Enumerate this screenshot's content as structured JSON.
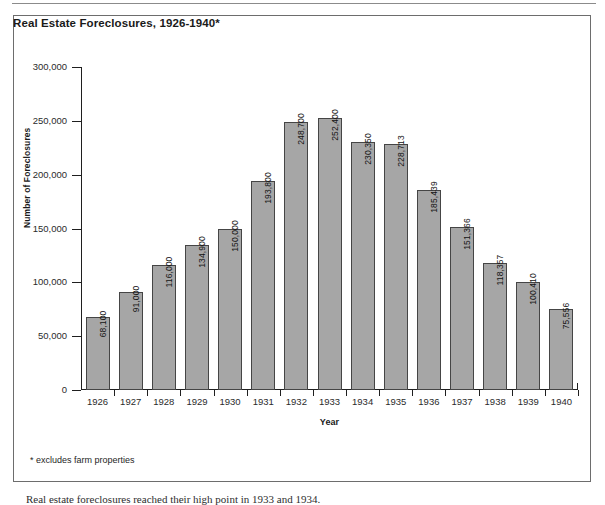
{
  "figure": {
    "title": "Real Estate Foreclosures, 1926-1940*",
    "footnote": "* excludes farm properties",
    "caption": "Real estate foreclosures reached their high point in 1933 and 1934."
  },
  "chart_data": {
    "type": "bar",
    "title": "Real Estate Foreclosures, 1926-1940*",
    "xlabel": "Year",
    "ylabel": "Number of Foreclosures",
    "categories": [
      "1926",
      "1927",
      "1928",
      "1929",
      "1930",
      "1931",
      "1932",
      "1933",
      "1934",
      "1935",
      "1936",
      "1937",
      "1938",
      "1939",
      "1940"
    ],
    "values": [
      68100,
      91000,
      116000,
      134900,
      150000,
      193800,
      248700,
      252400,
      230350,
      228713,
      185439,
      151366,
      118357,
      100410,
      75556
    ],
    "value_labels": [
      "68,100",
      "91,000",
      "116,000",
      "134,900",
      "150,000",
      "193,800",
      "248,700",
      "252,400",
      "230,350",
      "228,713",
      "185,439",
      "151,366",
      "118,357",
      "100,410",
      "75,556"
    ],
    "ylim": [
      0,
      300000
    ],
    "ytick_values": [
      0,
      50000,
      100000,
      150000,
      200000,
      250000,
      300000
    ],
    "ytick_labels": [
      "0",
      "50,000",
      "100,000",
      "150,000",
      "200,000",
      "250,000",
      "300,000"
    ],
    "grid": false,
    "legend": null,
    "bar_color": "#a6a6a6",
    "bar_border_color": "#454545",
    "axis_color": "#1f1f1f"
  }
}
